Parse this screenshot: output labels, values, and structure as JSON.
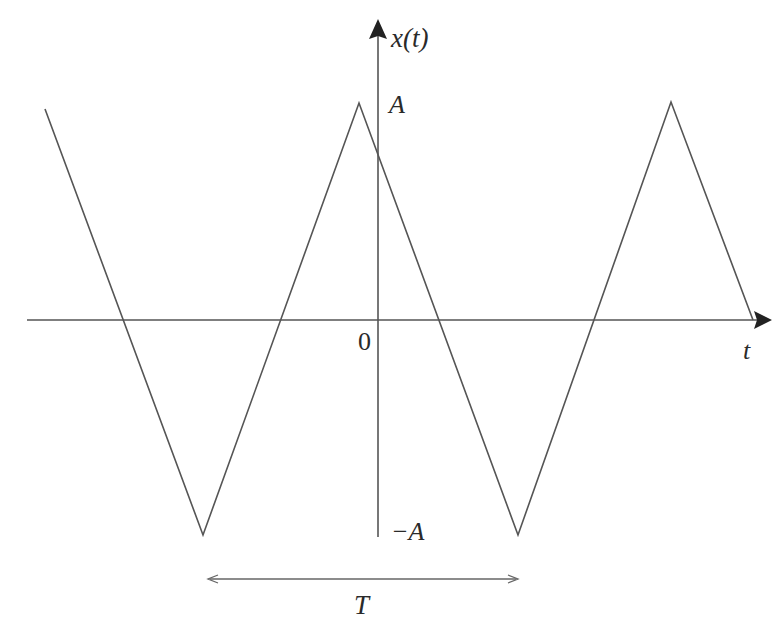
{
  "figure": {
    "type": "triangular-wave",
    "labels": {
      "y_axis": "x(t)",
      "x_axis": "t",
      "origin": "0",
      "amplitude_pos": "A",
      "amplitude_neg": "−A",
      "period": "T"
    },
    "colors": {
      "line": "#555555",
      "axis": "#555555",
      "text": "#2a2a2a",
      "background": "#ffffff"
    },
    "waveform_points": [
      [
        45,
        109
      ],
      [
        203,
        535
      ],
      [
        359,
        103
      ],
      [
        518,
        535
      ],
      [
        671,
        102
      ],
      [
        753,
        320
      ]
    ],
    "axes": {
      "x_axis": {
        "x1": 27,
        "x2": 772,
        "y": 320
      },
      "y_axis": {
        "x": 378,
        "y1": 20,
        "y2": 537
      }
    },
    "period_marker": {
      "x1": 208,
      "x2": 518,
      "y": 579
    }
  }
}
